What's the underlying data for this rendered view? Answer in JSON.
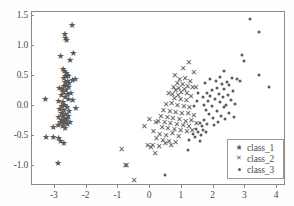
{
  "chart_data": {
    "type": "scatter",
    "title": "",
    "xlabel": "",
    "ylabel": "",
    "xlim": [
      -3.72,
      4.28
    ],
    "ylim": [
      -1.33,
      1.56
    ],
    "xticks": [
      "-3",
      "-2",
      "-1",
      "0",
      "1",
      "2",
      "3",
      "4"
    ],
    "xtick_values": [
      -3,
      -2,
      -1,
      0,
      1,
      2,
      3,
      4
    ],
    "yticks": [
      "1.5",
      "1.0",
      "0.5",
      "0.0",
      "-0.5",
      "-1.0"
    ],
    "ytick_values": [
      1.5,
      1.0,
      0.5,
      0.0,
      -0.5,
      -1.0
    ],
    "grid": false,
    "legend_position": "lower right",
    "marker_color": "#595959",
    "series": [
      {
        "name": "class_1",
        "marker": "star",
        "points": [
          [
            -2.46,
            1.35
          ],
          [
            -2.69,
            1.2
          ],
          [
            -2.66,
            1.12
          ],
          [
            -2.63,
            1.1
          ],
          [
            -2.82,
            0.83
          ],
          [
            -2.42,
            0.88
          ],
          [
            -2.52,
            0.76
          ],
          [
            -2.74,
            0.62
          ],
          [
            -2.7,
            0.58
          ],
          [
            -2.64,
            0.55
          ],
          [
            -2.62,
            0.52
          ],
          [
            -2.67,
            0.5
          ],
          [
            -2.58,
            0.49
          ],
          [
            -2.72,
            0.46
          ],
          [
            -2.36,
            0.44
          ],
          [
            -2.44,
            0.43
          ],
          [
            -2.6,
            0.42
          ],
          [
            -2.68,
            0.4
          ],
          [
            -2.55,
            0.38
          ],
          [
            -2.63,
            0.35
          ],
          [
            -2.71,
            0.33
          ],
          [
            -2.57,
            0.31
          ],
          [
            -2.86,
            0.29
          ],
          [
            -2.78,
            0.28
          ],
          [
            -2.65,
            0.26
          ],
          [
            -2.73,
            0.23
          ],
          [
            -2.5,
            0.22
          ],
          [
            -2.6,
            0.2
          ],
          [
            -2.8,
            0.18
          ],
          [
            -2.68,
            0.15
          ],
          [
            -3.3,
            0.12
          ],
          [
            -2.88,
            0.08
          ],
          [
            -2.75,
            0.06
          ],
          [
            -2.58,
            0.11
          ],
          [
            -2.44,
            0.1
          ],
          [
            -2.69,
            0.02
          ],
          [
            -2.78,
            0.0
          ],
          [
            -2.62,
            -0.02
          ],
          [
            -2.34,
            -0.03
          ],
          [
            -2.85,
            -0.05
          ],
          [
            -2.72,
            -0.07
          ],
          [
            -2.55,
            -0.09
          ],
          [
            -2.8,
            -0.12
          ],
          [
            -2.66,
            -0.14
          ],
          [
            -2.74,
            -0.16
          ],
          [
            -2.58,
            -0.17
          ],
          [
            -2.88,
            -0.19
          ],
          [
            -2.7,
            -0.2
          ],
          [
            -2.62,
            -0.22
          ],
          [
            -2.79,
            -0.24
          ],
          [
            -2.67,
            -0.25
          ],
          [
            -2.52,
            -0.26
          ],
          [
            -2.83,
            -0.27
          ],
          [
            -2.73,
            -0.29
          ],
          [
            -2.6,
            -0.3
          ],
          [
            -2.9,
            -0.32
          ],
          [
            -2.76,
            -0.33
          ],
          [
            -3.05,
            -0.35
          ],
          [
            -2.68,
            -0.37
          ],
          [
            -3.28,
            -0.52
          ],
          [
            -3.05,
            -0.51
          ],
          [
            -2.88,
            -0.53
          ],
          [
            -2.82,
            -0.58
          ],
          [
            -2.72,
            -0.62
          ],
          [
            -2.9,
            -0.94
          ]
        ]
      },
      {
        "name": "class_2",
        "marker": "x",
        "points": [
          [
            1.22,
            0.72
          ],
          [
            1.04,
            0.62
          ],
          [
            0.78,
            0.5
          ],
          [
            1.38,
            0.54
          ],
          [
            1.1,
            0.45
          ],
          [
            0.93,
            0.43
          ],
          [
            1.26,
            0.4
          ],
          [
            0.86,
            0.37
          ],
          [
            1.02,
            0.35
          ],
          [
            1.34,
            0.3
          ],
          [
            1.18,
            0.32
          ],
          [
            0.74,
            0.3
          ],
          [
            0.9,
            0.28
          ],
          [
            1.08,
            0.26
          ],
          [
            1.44,
            0.29
          ],
          [
            0.8,
            0.24
          ],
          [
            0.98,
            0.22
          ],
          [
            1.16,
            0.2
          ],
          [
            0.7,
            0.18
          ],
          [
            0.88,
            0.16
          ],
          [
            1.28,
            0.15
          ],
          [
            0.58,
            0.2
          ],
          [
            0.76,
            0.12
          ],
          [
            0.96,
            0.1
          ],
          [
            1.14,
            0.08
          ],
          [
            0.5,
            0.02
          ],
          [
            0.68,
            0.04
          ],
          [
            0.86,
            0.0
          ],
          [
            1.06,
            -0.02
          ],
          [
            1.24,
            -0.04
          ],
          [
            0.42,
            -0.08
          ],
          [
            0.62,
            -0.1
          ],
          [
            0.8,
            -0.12
          ],
          [
            1.0,
            -0.14
          ],
          [
            1.2,
            -0.13
          ],
          [
            1.38,
            -0.16
          ],
          [
            0.34,
            -0.18
          ],
          [
            0.54,
            -0.2
          ],
          [
            0.72,
            -0.22
          ],
          [
            0.92,
            -0.24
          ],
          [
            1.12,
            -0.26
          ],
          [
            1.3,
            -0.25
          ],
          [
            0.26,
            -0.26
          ],
          [
            0.46,
            -0.28
          ],
          [
            0.64,
            -0.3
          ],
          [
            0.84,
            -0.31
          ],
          [
            1.04,
            -0.33
          ],
          [
            1.22,
            -0.35
          ],
          [
            -0.18,
            -0.35
          ],
          [
            -0.02,
            -0.24
          ],
          [
            0.18,
            -0.28
          ],
          [
            0.38,
            -0.36
          ],
          [
            0.56,
            -0.38
          ],
          [
            0.76,
            -0.4
          ],
          [
            0.96,
            -0.42
          ],
          [
            1.16,
            -0.44
          ],
          [
            0.1,
            -0.44
          ],
          [
            0.3,
            -0.48
          ],
          [
            0.5,
            -0.5
          ],
          [
            0.7,
            -0.46
          ],
          [
            0.9,
            -0.52
          ],
          [
            0.2,
            -0.55
          ],
          [
            0.4,
            -0.58
          ],
          [
            0.6,
            -0.6
          ],
          [
            0.8,
            -0.62
          ],
          [
            0.08,
            -0.66
          ],
          [
            0.28,
            -0.68
          ],
          [
            0.48,
            -0.64
          ],
          [
            0.66,
            -0.66
          ],
          [
            -0.08,
            -0.67
          ],
          [
            0.02,
            -0.7
          ],
          [
            0.16,
            -0.8
          ],
          [
            -0.9,
            -0.74
          ],
          [
            -0.78,
            -1.0
          ],
          [
            -0.74,
            -1.0
          ],
          [
            -0.5,
            -1.24
          ],
          [
            1.46,
            -0.3
          ],
          [
            1.32,
            -0.42
          ]
        ]
      },
      {
        "name": "class_3",
        "marker": "dot",
        "points": [
          [
            3.14,
            1.44
          ],
          [
            3.42,
            1.22
          ],
          [
            2.88,
            0.84
          ],
          [
            2.96,
            0.74
          ],
          [
            3.44,
            0.52
          ],
          [
            2.34,
            0.58
          ],
          [
            2.58,
            0.46
          ],
          [
            2.74,
            0.44
          ],
          [
            2.82,
            0.42
          ],
          [
            2.2,
            0.48
          ],
          [
            2.42,
            0.4
          ],
          [
            2.06,
            0.42
          ],
          [
            3.74,
            0.31
          ],
          [
            1.9,
            0.44
          ],
          [
            2.26,
            0.36
          ],
          [
            2.5,
            0.34
          ],
          [
            1.74,
            0.38
          ],
          [
            2.12,
            0.3
          ],
          [
            2.34,
            0.28
          ],
          [
            1.96,
            0.26
          ],
          [
            2.6,
            0.24
          ],
          [
            1.78,
            0.22
          ],
          [
            2.16,
            0.2
          ],
          [
            2.44,
            0.18
          ],
          [
            1.88,
            0.16
          ],
          [
            2.28,
            0.14
          ],
          [
            2.04,
            0.12
          ],
          [
            2.56,
            0.1
          ],
          [
            1.82,
            0.08
          ],
          [
            2.2,
            0.06
          ],
          [
            2.4,
            0.02
          ],
          [
            1.94,
            0.0
          ],
          [
            2.32,
            -0.02
          ],
          [
            2.66,
            0.04
          ],
          [
            1.76,
            -0.06
          ],
          [
            2.1,
            -0.08
          ],
          [
            2.48,
            -0.12
          ],
          [
            1.86,
            -0.14
          ],
          [
            2.24,
            -0.16
          ],
          [
            2.64,
            -0.18
          ],
          [
            1.98,
            -0.2
          ],
          [
            2.36,
            -0.22
          ],
          [
            1.7,
            -0.24
          ],
          [
            2.14,
            -0.26
          ],
          [
            1.8,
            -0.3
          ],
          [
            2.02,
            -0.32
          ],
          [
            1.62,
            -0.34
          ],
          [
            1.56,
            -0.28
          ],
          [
            1.44,
            -0.38
          ],
          [
            1.68,
            -0.4
          ],
          [
            1.5,
            -0.44
          ],
          [
            1.34,
            -0.46
          ],
          [
            1.6,
            -0.48
          ],
          [
            1.76,
            -0.44
          ],
          [
            1.4,
            -0.52
          ],
          [
            1.24,
            -0.56
          ],
          [
            1.58,
            -0.58
          ],
          [
            1.2,
            -0.73
          ],
          [
            0.48,
            -1.15
          ],
          [
            1.48,
            0.08
          ],
          [
            1.66,
            0.14
          ],
          [
            1.52,
            0.22
          ],
          [
            1.7,
            0.02
          ],
          [
            1.38,
            0.0
          ]
        ]
      }
    ]
  },
  "legend": {
    "entries": [
      {
        "label": "class_1",
        "marker": "star"
      },
      {
        "label": "class_2",
        "marker": "x"
      },
      {
        "label": "class_3",
        "marker": "dot"
      }
    ]
  }
}
